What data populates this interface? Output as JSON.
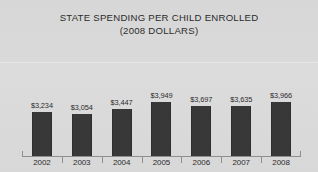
{
  "chart_data": {
    "type": "bar",
    "title": "STATE SPENDING PER CHILD ENROLLED",
    "subtitle": "(2008 DOLLARS)",
    "title_lines": [
      "STATE SPENDING PER CHILD ENROLLED",
      "(2008 DOLLARS)"
    ],
    "xlabel": "",
    "ylabel": "",
    "categories": [
      "2002",
      "2003",
      "2004",
      "2005",
      "2006",
      "2007",
      "2008"
    ],
    "values": [
      3234,
      3054,
      3447,
      3949,
      3697,
      3635,
      3966
    ],
    "value_labels": [
      "$3,234",
      "$3,054",
      "$3,447",
      "$3,949",
      "$3,697",
      "$3,635",
      "$3,966"
    ],
    "ylim": [
      0,
      4400
    ],
    "grid": false,
    "legend": null,
    "series": [
      {
        "name": "State spending per child enrolled",
        "values": [
          3234,
          3054,
          3447,
          3949,
          3697,
          3635,
          3966
        ]
      }
    ],
    "colors": {
      "bar": "#383838",
      "background": "#d8d8d8",
      "text": "#2b2b2b",
      "axis": "#8f8f8f"
    }
  }
}
